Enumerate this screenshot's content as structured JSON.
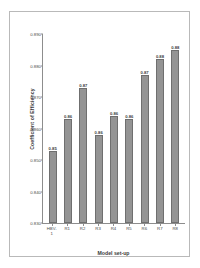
{
  "chart_data": {
    "type": "bar",
    "title": "",
    "xlabel": "Model set-up",
    "ylabel": "Coefficient of Efficiency",
    "categories": [
      "HBV-1",
      "R1",
      "R2",
      "R3",
      "R4",
      "R5",
      "R6",
      "R7",
      "R8"
    ],
    "values": [
      0.853,
      0.863,
      0.873,
      0.858,
      0.864,
      0.863,
      0.877,
      0.882,
      0.885
    ],
    "data_labels": [
      "0.85",
      "0.86",
      "0.87",
      "0.86",
      "0.86",
      "0.86",
      "0.87",
      "0.88",
      "0.88"
    ],
    "ylim": [
      0.83,
      0.89
    ],
    "ytick_values": [
      0.89,
      0.88,
      0.87,
      0.86,
      0.85,
      0.84,
      0.83
    ],
    "ytick_labels": [
      "0.890",
      "0.880",
      "0.870",
      "0.860",
      "0.850",
      "0.840",
      "0.830"
    ],
    "grid": false,
    "legend": null,
    "bar_color": "#949494",
    "bar_edge_color": "#6f6f6f",
    "axis_color": "#8d8d8d",
    "background": "#ffffff"
  }
}
